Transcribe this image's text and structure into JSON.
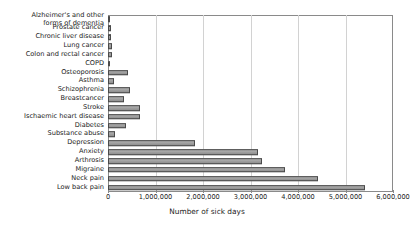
{
  "chart_data": {
    "type": "bar",
    "orientation": "horizontal",
    "title": "",
    "xlabel": "Number of sick days",
    "ylabel": "",
    "xlim": [
      0,
      6000000
    ],
    "xticks": [
      0,
      1000000,
      2000000,
      3000000,
      4000000,
      5000000,
      6000000
    ],
    "xtick_labels": [
      "0",
      "1,000,000",
      "2,000,000",
      "3,000,000",
      "4,000,000",
      "5,000,000",
      "6,000,000"
    ],
    "grid": true,
    "grid_axis": "x",
    "legend": false,
    "bar_color": "#9b9b9b",
    "bar_edge_color": "#4a4a4a",
    "categories": [
      "Alzheimer's and other\nforms of dementia",
      "Prostate cancer",
      "Chronic liver disease",
      "Lung cancer",
      "Colon and rectal cancer",
      "COPD",
      "Osteoporosis",
      "Asthma",
      "Schizophrenia",
      "Breastcancer",
      "Stroke",
      "Ischaemic heart disease",
      "Diabetes",
      "Substance abuse",
      "Depression",
      "Anxiety",
      "Arthrosis",
      "Migraine",
      "Neck pain",
      "Low back pain"
    ],
    "values": [
      40000,
      60000,
      70000,
      80000,
      90000,
      50000,
      420000,
      120000,
      460000,
      330000,
      670000,
      670000,
      380000,
      150000,
      1830000,
      3160000,
      3250000,
      3730000,
      4420000,
      5410000
    ]
  }
}
